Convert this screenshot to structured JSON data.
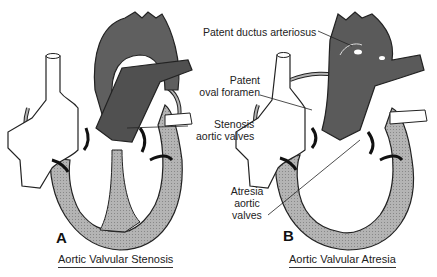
{
  "panels": [
    {
      "letter": "A",
      "caption": "Aortic Valvular Stenosis",
      "labels": {
        "stenosis_line1": "Stenosis",
        "stenosis_line2": "aortic valves"
      }
    },
    {
      "letter": "B",
      "caption": "Aortic Valvular Atresia",
      "labels": {
        "pda": "Patent ductus arteriosus",
        "pfo_line1": "Patent",
        "pfo_line2": "oval foramen",
        "atresia_line1": "Atresia",
        "atresia_line2": "aortic",
        "atresia_line3": "valves"
      }
    }
  ],
  "colors": {
    "great_vessels": "#5f5f5f",
    "myocardium": "#a8a8a8",
    "outline": "#222222",
    "background": "#ffffff"
  }
}
